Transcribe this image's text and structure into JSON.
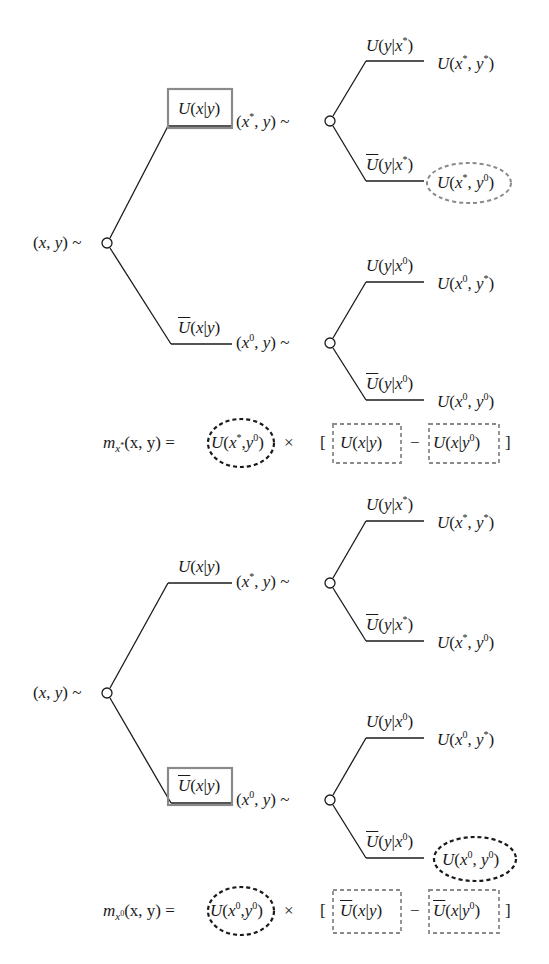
{
  "diagram": {
    "type": "probability-tree",
    "colors": {
      "line": "#1a1a1a",
      "highlight_gray": "#8a8a8a",
      "highlight_black": "#1a1a1a"
    },
    "trees": [
      {
        "root": {
          "label_a": "(",
          "x": "x",
          "sep": ", ",
          "y": "y",
          "tail": ") ~"
        },
        "upper_branch": {
          "label": "U(x|y)",
          "highlight": "gray-box",
          "node_label": "(x*, y) ~",
          "leaves": [
            {
              "branch_label": "U(y|x*)",
              "outcome": "U(x*, y*)",
              "highlight": "none"
            },
            {
              "branch_label": "Ū(y|x*)",
              "outcome": "U(x*, y⁰)",
              "highlight": "gray-dashed-ellipse"
            }
          ]
        },
        "lower_branch": {
          "label": "Ū(x|y)",
          "highlight": "none",
          "node_label": "(x⁰, y) ~",
          "leaves": [
            {
              "branch_label": "U(y|x⁰)",
              "outcome": "U(x⁰, y*)",
              "highlight": "none"
            },
            {
              "branch_label": "Ū(y|x⁰)",
              "outcome": "U(x⁰, y⁰)",
              "highlight": "none"
            }
          ]
        },
        "formula": {
          "lhs": "m_{x*}(x, y) =",
          "factor": "U(x*, y⁰)",
          "times": "×",
          "term1": "U(x|y)",
          "minus": "−",
          "term2": "U(x|y⁰)"
        }
      },
      {
        "root": {
          "label_a": "(",
          "x": "x",
          "sep": ", ",
          "y": "y",
          "tail": ") ~"
        },
        "upper_branch": {
          "label": "U(x|y)",
          "highlight": "none",
          "node_label": "(x*, y) ~",
          "leaves": [
            {
              "branch_label": "U(y|x*)",
              "outcome": "U(x*, y*)",
              "highlight": "none"
            },
            {
              "branch_label": "Ū(y|x*)",
              "outcome": "U(x*, y⁰)",
              "highlight": "none"
            }
          ]
        },
        "lower_branch": {
          "label": "Ū(x|y)",
          "highlight": "gray-box",
          "node_label": "(x⁰, y) ~",
          "leaves": [
            {
              "branch_label": "U(y|x⁰)",
              "outcome": "U(x⁰, y*)",
              "highlight": "none"
            },
            {
              "branch_label": "Ū(y|x⁰)",
              "outcome": "U(x⁰, y⁰)",
              "highlight": "black-dashed-ellipse"
            }
          ]
        },
        "formula": {
          "lhs": "m_{x⁰}(x, y) =",
          "factor": "U(x⁰, y⁰)",
          "times": "×",
          "term1": "Ū(x|y)",
          "minus": "−",
          "term2": "Ū(x|y⁰)"
        }
      }
    ],
    "text": {
      "U": "U",
      "open": "(",
      "close": ")",
      "bar": "|",
      "comma": ", ",
      "commaTight": ",",
      "x": "x",
      "y": "y",
      "star": "*",
      "zero": "0",
      "tilde": " ~",
      "m": "m",
      "eq": "(x, y) =",
      "times": "×",
      "lbr": "[",
      "rbr": "]",
      "minus": "−"
    },
    "caption": {
      "visible": "partial",
      "text": ""
    }
  }
}
